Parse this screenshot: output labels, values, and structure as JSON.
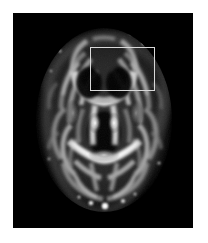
{
  "figure": {
    "modality": "MRI",
    "sequence": "DTI fractional anisotropy map",
    "view": "axial",
    "title": "Axial brain FA map with ROI",
    "caption": "",
    "colormap": "grayscale",
    "background_color": "#ffffff",
    "panel_background_color": "#000000",
    "panel": {
      "x": 13,
      "y": 13,
      "width": 180,
      "height": 215
    }
  },
  "roi": {
    "label": "",
    "shape": "rectangle",
    "stroke_color": "#d8d8d8",
    "stroke_width": 1,
    "fill": "none",
    "x": 90,
    "y": 47,
    "width": 65,
    "height": 44,
    "region": "right anterior white matter / genu of corpus callosum"
  },
  "brain": {
    "center_x": 104,
    "center_y": 120,
    "radius_x": 66,
    "radius_y": 90,
    "intensity_min": 0,
    "intensity_max": 255
  },
  "structures": [
    {
      "name": "genu-of-corpus-callosum",
      "intensity": 230
    },
    {
      "name": "splenium-of-corpus-callosum",
      "intensity": 245
    },
    {
      "name": "anterior-forceps",
      "intensity": 210
    },
    {
      "name": "posterior-forceps",
      "intensity": 225
    },
    {
      "name": "internal-capsule-left",
      "intensity": 200
    },
    {
      "name": "internal-capsule-right",
      "intensity": 200
    },
    {
      "name": "superior-longitudinal-fasciculus-left",
      "intensity": 180
    },
    {
      "name": "superior-longitudinal-fasciculus-right",
      "intensity": 180
    },
    {
      "name": "lateral-ventricle-left",
      "intensity": 15
    },
    {
      "name": "lateral-ventricle-right",
      "intensity": 15
    },
    {
      "name": "cortical-gray-matter",
      "intensity": 55
    }
  ]
}
